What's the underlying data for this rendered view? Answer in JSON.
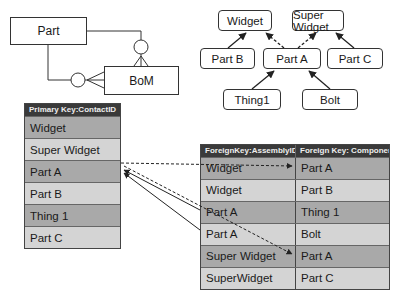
{
  "er_diagram": {
    "entities": [
      {
        "id": "part",
        "label": "Part"
      },
      {
        "id": "bom",
        "label": "BoM"
      }
    ]
  },
  "hierarchy": {
    "nodes": [
      {
        "id": "widget",
        "label": "Widget"
      },
      {
        "id": "super_widget",
        "label": "Super Widget"
      },
      {
        "id": "part_b",
        "label": "Part B"
      },
      {
        "id": "part_a",
        "label": "Part A"
      },
      {
        "id": "part_c",
        "label": "Part C"
      },
      {
        "id": "thing1",
        "label": "Thing1"
      },
      {
        "id": "bolt",
        "label": "Bolt"
      }
    ],
    "edges": [
      {
        "from": "part_b",
        "to": "widget",
        "style": "solid"
      },
      {
        "from": "part_a",
        "to": "widget",
        "style": "dashed"
      },
      {
        "from": "part_a",
        "to": "super_widget",
        "style": "dashed"
      },
      {
        "from": "part_c",
        "to": "super_widget",
        "style": "solid"
      },
      {
        "from": "thing1",
        "to": "part_a",
        "style": "solid"
      },
      {
        "from": "bolt",
        "to": "part_a",
        "style": "solid"
      }
    ]
  },
  "parts_table": {
    "header": "Primary Key:ContactID",
    "rows": [
      "Widget",
      "Super Widget",
      "Part A",
      "Part B",
      "Thing 1",
      "Part C"
    ]
  },
  "bom_table": {
    "headers": [
      "ForeignKey:AssemblyID",
      "Foreign Key: ComponentID"
    ],
    "rows": [
      [
        "Widget",
        "Part A"
      ],
      [
        "Widget",
        "Part B"
      ],
      [
        "Part A",
        "Thing 1"
      ],
      [
        "Part A",
        "Bolt"
      ],
      [
        "Super Widget",
        "Part A"
      ],
      [
        "SuperWidget",
        "Part C"
      ]
    ]
  }
}
